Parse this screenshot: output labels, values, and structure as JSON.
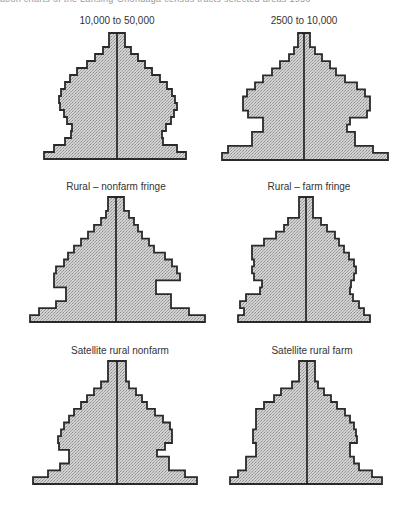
{
  "header_fragment": "ation charts of the Lansing-Onondaga census tracts selected areas 1950",
  "chart_data": {
    "type": "area",
    "rows_order": "top (oldest) to bottom (youngest)",
    "colors": {
      "fill": "#c4c4c4",
      "outline": "#2a2a2a",
      "center_line": "#1a1a1a"
    },
    "pyramids": [
      {
        "title": "10,000 to 50,000",
        "left": [
          8,
          8,
          14,
          22,
          30,
          40,
          47,
          52,
          56,
          58,
          57,
          53,
          50,
          45,
          46,
          52,
          63,
          73
        ],
        "right": [
          8,
          8,
          14,
          21,
          28,
          35,
          43,
          50,
          55,
          58,
          60,
          57,
          54,
          49,
          45,
          46,
          60,
          69
        ]
      },
      {
        "title": "2500 to 10,000",
        "left": [
          6,
          6,
          10,
          15,
          24,
          32,
          41,
          49,
          57,
          61,
          61,
          56,
          41,
          41,
          52,
          52,
          76,
          82
        ],
        "right": [
          6,
          6,
          11,
          18,
          26,
          32,
          41,
          53,
          61,
          66,
          66,
          63,
          46,
          43,
          51,
          51,
          69,
          84
        ]
      },
      {
        "title": "Rural – nonfarm fringe",
        "left": [
          8,
          8,
          10,
          15,
          22,
          28,
          35,
          42,
          48,
          52,
          60,
          62,
          62,
          50,
          50,
          60,
          77,
          86
        ],
        "right": [
          8,
          8,
          13,
          18,
          22,
          26,
          33,
          38,
          49,
          56,
          61,
          64,
          40,
          40,
          55,
          55,
          73,
          89
        ]
      },
      {
        "title": "Rural – farm fringe",
        "left": [
          7,
          7,
          7,
          18,
          22,
          30,
          42,
          54,
          54,
          52,
          54,
          52,
          44,
          46,
          60,
          66,
          62,
          68
        ],
        "right": [
          7,
          7,
          7,
          15,
          21,
          29,
          33,
          38,
          43,
          48,
          50,
          48,
          45,
          44,
          47,
          53,
          58,
          64
        ]
      },
      {
        "title": "Satellite rural nonfarm",
        "left": [
          9,
          9,
          9,
          16,
          23,
          30,
          36,
          43,
          48,
          53,
          56,
          59,
          58,
          48,
          48,
          57,
          69,
          84
        ],
        "right": [
          9,
          9,
          9,
          12,
          19,
          25,
          30,
          38,
          46,
          53,
          55,
          55,
          48,
          40,
          52,
          52,
          68,
          80
        ]
      },
      {
        "title": "Satellite rural farm",
        "left": [
          8,
          8,
          8,
          15,
          26,
          33,
          43,
          51,
          51,
          51,
          54,
          54,
          51,
          51,
          61,
          61,
          69,
          77
        ],
        "right": [
          8,
          8,
          8,
          11,
          17,
          24,
          30,
          38,
          43,
          47,
          49,
          50,
          43,
          43,
          47,
          52,
          65,
          75
        ]
      }
    ]
  },
  "panels": [
    {
      "title": "10,000 to 50,000"
    },
    {
      "title": "2500 to 10,000"
    },
    {
      "title": "Rural – nonfarm fringe"
    },
    {
      "title": "Rural – farm fringe"
    },
    {
      "title": "Satellite rural nonfarm"
    },
    {
      "title": "Satellite rural farm"
    }
  ]
}
